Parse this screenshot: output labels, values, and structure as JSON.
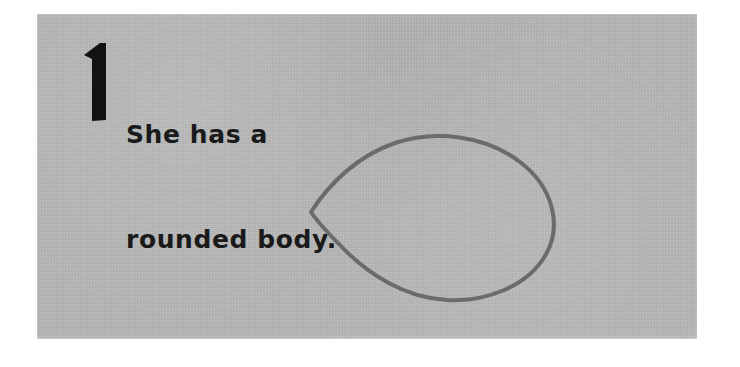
{
  "page": {
    "kind": "scanned-drawing-tutorial-step",
    "background_color": "#ffffff",
    "paper_color": "#b4b4b4"
  },
  "step": {
    "number": "1",
    "number_icon": "numeral-one-bold",
    "instruction_lines": [
      "She has a",
      "rounded body."
    ],
    "instruction_full": "She has a rounded body.",
    "text_color": "#1a1a1a"
  },
  "drawing": {
    "name": "rounded-body-outline",
    "shape": "egg-leaf-oval-pointed-left",
    "stroke_color": "#6b6b6b",
    "stroke_width": 4,
    "fill": "none",
    "description": "Hand-drawn closed outline, sharp point at the left side, wide rounded curve at the right side."
  }
}
